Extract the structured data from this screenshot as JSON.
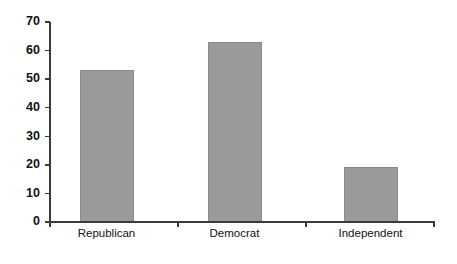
{
  "chart_data": {
    "type": "bar",
    "title": "",
    "subtitle": "",
    "xlabel": "",
    "ylabel": "",
    "categories": [
      "Republican",
      "Democrat",
      "Independent"
    ],
    "values": [
      53,
      63,
      19
    ],
    "series": [
      {
        "name": "Count",
        "values": [
          53,
          63,
          19
        ]
      }
    ],
    "ylim": [
      0,
      70
    ],
    "y_ticks": [
      0,
      10,
      20,
      30,
      40,
      50,
      60,
      70
    ],
    "y_tick_labels": [
      "0",
      "10",
      "20",
      "30",
      "40",
      "50",
      "60",
      "70"
    ],
    "x_tick_labels": [
      "Republican",
      "Democrat",
      "Independent"
    ],
    "grid": false,
    "legend": false,
    "legend_position": "none",
    "annotations": [],
    "colors": {
      "bar_fill": "#9a9a9a",
      "bar_edge": "#8a8a8a",
      "axis": "#3a3a3a",
      "text": "#111111",
      "background": "#ffffff"
    }
  },
  "chart_geometry": {
    "plot_left": 50,
    "plot_right": 435,
    "plot_top": 22,
    "plot_bottom": 222,
    "bar_width": 53,
    "bar_centers": [
      106.5,
      234.5,
      370.5
    ],
    "x_tick_positions": [
      50,
      178,
      306,
      434
    ],
    "x_label_y": 229,
    "tick_length": 5
  }
}
